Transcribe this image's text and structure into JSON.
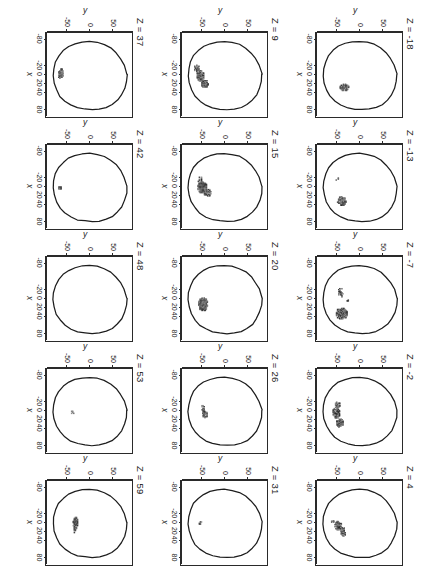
{
  "figure": {
    "type": "multi-panel-slice-plot",
    "rows": 3,
    "cols": 5,
    "axis": {
      "x_title": "x",
      "y_title": "y",
      "x_ticks": [
        "-80",
        "-20",
        "0",
        "20",
        "40",
        "80"
      ],
      "x_tick_values": [
        -80,
        -20,
        0,
        20,
        40,
        80
      ],
      "y_ticks": [
        "50",
        "0",
        "-50"
      ],
      "y_tick_values": [
        50,
        0,
        -50
      ],
      "xlim": [
        -95,
        95
      ],
      "ylim": [
        -95,
        95
      ]
    }
  },
  "chart_data": {
    "type": "scatter",
    "title": "",
    "xlabel": "x",
    "ylabel": "y",
    "xlim": [
      -95,
      95
    ],
    "ylim": [
      -95,
      95
    ],
    "grid": false,
    "legend": "none",
    "panel_variable": "Z",
    "panels": [
      {
        "label": "Z = -18",
        "z": -18,
        "outline": "head",
        "clusters": [
          {
            "cx": 28,
            "cy": -32,
            "rx": 7,
            "ry": 8,
            "density": 0.55
          }
        ]
      },
      {
        "label": "Z = -13",
        "z": -13,
        "outline": "head",
        "clusters": [
          {
            "cx": 32,
            "cy": -38,
            "rx": 9,
            "ry": 9,
            "density": 0.6
          },
          {
            "cx": -18,
            "cy": -48,
            "rx": 2,
            "ry": 2,
            "density": 0.3
          }
        ]
      },
      {
        "label": "Z = -7",
        "z": -7,
        "outline": "head",
        "clusters": [
          {
            "cx": 33,
            "cy": -38,
            "rx": 12,
            "ry": 11,
            "density": 0.72
          },
          {
            "cx": -14,
            "cy": -40,
            "rx": 8,
            "ry": 4,
            "density": 0.45
          },
          {
            "cx": 2,
            "cy": -26,
            "rx": 2,
            "ry": 3,
            "density": 0.3
          }
        ]
      },
      {
        "label": "Z = -2",
        "z": -2,
        "outline": "head",
        "clusters": [
          {
            "cx": 27,
            "cy": -42,
            "rx": 9,
            "ry": 6,
            "density": 0.6
          },
          {
            "cx": 4,
            "cy": -50,
            "rx": 12,
            "ry": 7,
            "density": 0.62
          },
          {
            "cx": -13,
            "cy": -47,
            "rx": 6,
            "ry": 5,
            "density": 0.5
          }
        ]
      },
      {
        "label": "Z = 4",
        "z": 4,
        "outline": "head",
        "clusters": [
          {
            "cx": 20,
            "cy": -35,
            "rx": 8,
            "ry": 5,
            "density": 0.58
          },
          {
            "cx": 6,
            "cy": -46,
            "rx": 9,
            "ry": 7,
            "density": 0.66
          },
          {
            "cx": -2,
            "cy": -58,
            "rx": 2,
            "ry": 2,
            "density": 0.3
          }
        ]
      },
      {
        "label": "Z = 9",
        "z": 9,
        "outline": "head",
        "clusters": [
          {
            "cx": 20,
            "cy": -42,
            "rx": 7,
            "ry": 7,
            "density": 0.7
          },
          {
            "cx": 2,
            "cy": -52,
            "rx": 10,
            "ry": 7,
            "density": 0.72
          },
          {
            "cx": -15,
            "cy": -60,
            "rx": 6,
            "ry": 5,
            "density": 0.5
          }
        ]
      },
      {
        "label": "Z = 15",
        "z": 15,
        "outline": "head",
        "clusters": [
          {
            "cx": 13,
            "cy": -36,
            "rx": 6,
            "ry": 6,
            "density": 0.55
          },
          {
            "cx": 1,
            "cy": -48,
            "rx": 12,
            "ry": 8,
            "density": 0.74
          },
          {
            "cx": -15,
            "cy": -52,
            "rx": 6,
            "ry": 5,
            "density": 0.5
          }
        ]
      },
      {
        "label": "Z = 20",
        "z": 20,
        "outline": "head",
        "clusters": [
          {
            "cx": 12,
            "cy": -46,
            "rx": 14,
            "ry": 9,
            "density": 0.75
          }
        ]
      },
      {
        "label": "Z = 26",
        "z": 26,
        "outline": "head",
        "clusters": [
          {
            "cx": 8,
            "cy": -42,
            "rx": 7,
            "ry": 5,
            "density": 0.55
          },
          {
            "cx": -5,
            "cy": -46,
            "rx": 8,
            "ry": 3,
            "density": 0.45
          }
        ]
      },
      {
        "label": "Z = 31",
        "z": 31,
        "outline": "head",
        "clusters": [
          {
            "cx": 0,
            "cy": -52,
            "rx": 3,
            "ry": 2,
            "density": 0.3
          }
        ]
      },
      {
        "label": "Z = 37",
        "z": 37,
        "outline": "head",
        "clusters": [
          {
            "cx": -2,
            "cy": -62,
            "rx": 10,
            "ry": 4,
            "density": 0.45
          }
        ]
      },
      {
        "label": "Z = 42",
        "z": 42,
        "outline": "head",
        "clusters": [
          {
            "cx": 2,
            "cy": -64,
            "rx": 3,
            "ry": 3,
            "density": 0.5
          }
        ]
      },
      {
        "label": "Z = 48",
        "z": 48,
        "outline": "head",
        "clusters": []
      },
      {
        "label": "Z = 53",
        "z": 53,
        "outline": "head",
        "clusters": [
          {
            "cx": 3,
            "cy": -36,
            "rx": 3,
            "ry": 2,
            "density": 0.4
          }
        ]
      },
      {
        "label": "Z = 59",
        "z": 59,
        "outline": "head",
        "clusters": [
          {
            "cx": -1,
            "cy": -30,
            "rx": 11,
            "ry": 4,
            "density": 0.6
          },
          {
            "cx": 17,
            "cy": -30,
            "rx": 4,
            "ry": 3,
            "density": 0.5
          }
        ]
      }
    ]
  }
}
